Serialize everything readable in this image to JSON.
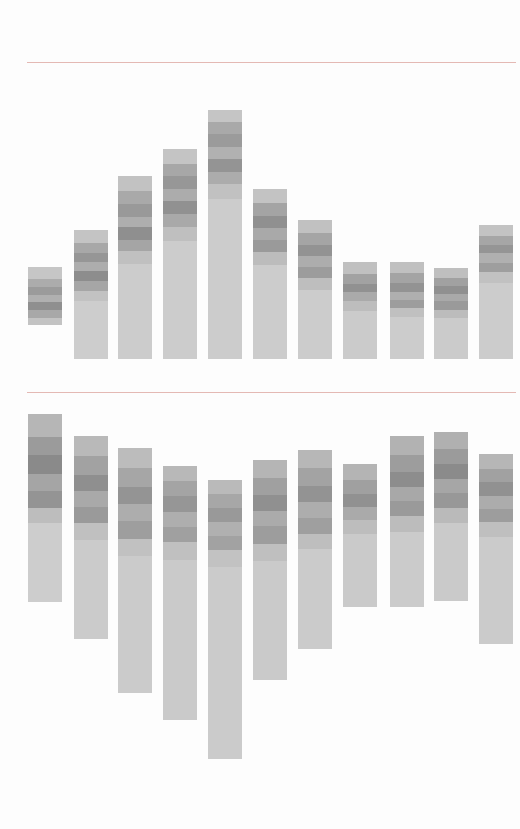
{
  "page": {
    "number": "216"
  },
  "header": {
    "years": [
      {
        "label": "'91",
        "color": "#3f3f3f",
        "x": 22
      },
      {
        "label": "'92",
        "color": "#414141",
        "x": 78
      },
      {
        "label": "'93",
        "color": "#484848",
        "x": 133
      },
      {
        "label": "'94",
        "color": "#595959",
        "x": 186
      },
      {
        "label": "'95",
        "color": "#6a6a6a",
        "x": 240
      },
      {
        "label": "'96",
        "color": "#7d7d7d",
        "x": 293
      },
      {
        "label": "'97",
        "color": "#9d9d9d",
        "x": 346
      },
      {
        "label": "'98",
        "color": "#ababab",
        "x": 396
      },
      {
        "label": "'99",
        "color": "#cfcfcf",
        "x": 444
      },
      {
        "label": "'00",
        "color": "#dcdcdc",
        "x": 487
      },
      {
        "label": "'01",
        "color": "#d3d3d3",
        "x": 530
      }
    ]
  },
  "top_chart": {
    "caption": [
      "전입지 경기도 기준",
      "지역별 순인구이동",
      "(통계청)"
    ],
    "y_labels": [
      "40만 명",
      "30만 명",
      "20만 명",
      "10만 명",
      "0"
    ]
  },
  "bottom_chart": {
    "caption": [
      "전입지 서울시 기준",
      "지역별 순인구이동",
      "(통계청)"
    ],
    "y_labels": [
      "10만 명",
      "0",
      "-10만 명",
      "-20만 명",
      "-30만 명"
    ]
  },
  "chart_data": [
    {
      "type": "bar",
      "title": "전입지 경기도 기준 지역별 순인구이동 (통계청)",
      "xlabel": "",
      "ylabel": "명",
      "ylim": [
        0,
        400000
      ],
      "grid": false,
      "legend": "none",
      "categories": [
        "'91",
        "'92",
        "'93",
        "'94",
        "'95",
        "'96",
        "'97",
        "'98",
        "'99",
        "'00",
        "'01"
      ],
      "values": [
        124000,
        174000,
        246000,
        283000,
        336000,
        229000,
        187000,
        130000,
        131000,
        123000,
        180000
      ],
      "data_labels": [
        "12만 4천 명",
        "17만 4천 명",
        "24만 6천 명",
        "28만 3천 명",
        "33만 6천 명",
        "22만 9천 명",
        "18만 7천 명",
        "13만 명",
        "13만 1천 명",
        "12만 3천 명",
        "18만 명"
      ]
    },
    {
      "type": "bar",
      "title": "전입지 서울시 기준 지역별 순인구이동 (통계청)",
      "xlabel": "",
      "ylabel": "명",
      "ylim": [
        -360000,
        130000
      ],
      "grid": false,
      "legend": "none",
      "categories": [
        "'91",
        "'92",
        "'93",
        "'94",
        "'95",
        "'96",
        "'97",
        "'98",
        "'99",
        "'00",
        "'01"
      ],
      "values": [
        -124000,
        -174000,
        -246000,
        -283000,
        -336000,
        -229000,
        -187000,
        -130000,
        -131000,
        -123000,
        -180000
      ],
      "data_labels": [
        "-12만 4천 명",
        "-17만 4천 명",
        "-24만 6천 명",
        "-28만 3천 명",
        "-33만 6천 명",
        "-22만 9천 명",
        "-18만 7천 명",
        "-13만 명",
        "-13만 1천 명",
        "-12만 3천 명",
        "-18만 명"
      ]
    }
  ]
}
